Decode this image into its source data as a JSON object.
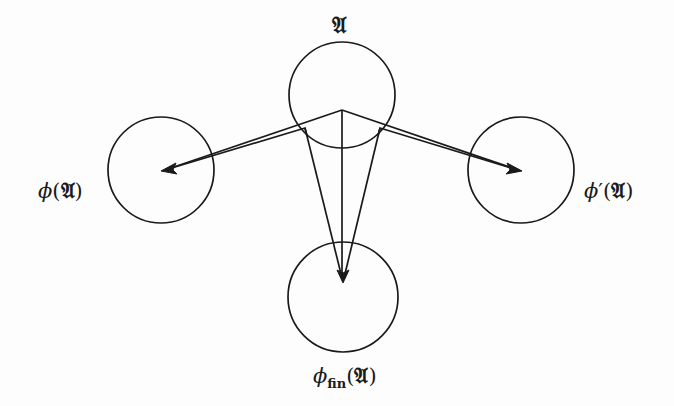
{
  "diagram": {
    "nodes": [
      {
        "id": "A",
        "label_main": "𝔄",
        "center": [
          342,
          95
        ],
        "radius": 53
      },
      {
        "id": "phi_A",
        "label_phi": "ϕ",
        "label_prime": "",
        "label_open": "(",
        "label_frak": "𝔄",
        "label_close": ")",
        "center": [
          161,
          170
        ],
        "radius": 53
      },
      {
        "id": "phi_prime_A",
        "label_phi": "ϕ",
        "label_prime": "′",
        "label_open": "(",
        "label_frak": "𝔄",
        "label_close": ")",
        "center": [
          521,
          170
        ],
        "radius": 53
      },
      {
        "id": "phi_fin_A",
        "label_phi": "ϕ",
        "label_sub": "fin",
        "label_open": "(",
        "label_frak": "𝔄",
        "label_close": ")",
        "center": [
          343,
          297
        ],
        "radius": 55
      }
    ],
    "edges": [
      {
        "from": "A",
        "to": "phi_A",
        "style": "double-line arrow"
      },
      {
        "from": "A",
        "to": "phi_prime_A",
        "style": "double-line arrow"
      },
      {
        "from": "A",
        "to": "phi_fin_A",
        "style": "wedge arrow"
      }
    ],
    "stroke_color": "#1a1a1a",
    "background_color": "#fdfdfd"
  }
}
